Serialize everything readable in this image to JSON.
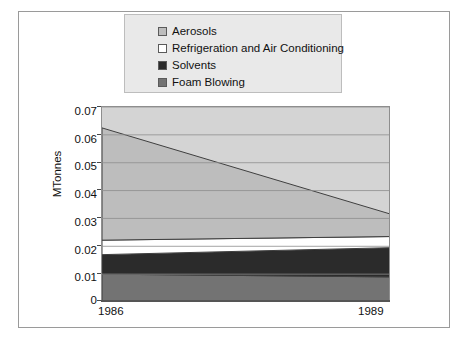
{
  "figure": {
    "background_color": "#ffffff",
    "frame_color": "#9a9a9a"
  },
  "legend": {
    "position": "top-center",
    "background_color": "#e9e9e9",
    "border_color": "#bdbdbd",
    "items": [
      {
        "label": "Aerosols",
        "color": "#bdbdbd",
        "icon": "legend-swatch-icon"
      },
      {
        "label": "Refrigeration and Air Conditioning",
        "color": "#ffffff",
        "icon": "legend-swatch-icon"
      },
      {
        "label": "Solvents",
        "color": "#2b2b2b",
        "icon": "legend-swatch-icon"
      },
      {
        "label": "Foam Blowing",
        "color": "#737373",
        "icon": "legend-swatch-icon"
      }
    ]
  },
  "axes": {
    "y_title": "MTonnes",
    "y_ticks": [
      "0.07",
      "0.06",
      "0.05",
      "0.04",
      "0.03",
      "0.02",
      "0.01",
      "0"
    ],
    "x_ticks": [
      "1986",
      "1989"
    ],
    "plot_background": "#d4d4d4",
    "gridline_color": "#8e8e8e"
  },
  "chart_data": {
    "type": "area",
    "title": "",
    "subtitle": "",
    "xlabel": "",
    "ylabel": "MTonnes",
    "x": [
      1986,
      1989
    ],
    "xlim": [
      1986,
      1989
    ],
    "ylim": [
      0,
      0.07
    ],
    "ytick_values": [
      0,
      0.01,
      0.02,
      0.03,
      0.04,
      0.05,
      0.06,
      0.07
    ],
    "grid": true,
    "stacked": true,
    "legend_position": "top-center",
    "series": [
      {
        "name": "Foam Blowing",
        "values": [
          0.01,
          0.009
        ],
        "color": "#737373"
      },
      {
        "name": "Solvents",
        "values": [
          0.007,
          0.0105
        ],
        "color": "#2b2b2b"
      },
      {
        "name": "Refrigeration and Air Conditioning",
        "values": [
          0.0052,
          0.004
        ],
        "color": "#ffffff"
      },
      {
        "name": "Aerosols",
        "values": [
          0.0403,
          0.008
        ],
        "color": "#bdbdbd"
      }
    ],
    "cumulative_tops": {
      "Foam Blowing": [
        0.01,
        0.009
      ],
      "Solvents": [
        0.017,
        0.0195
      ],
      "Refrigeration and Air Conditioning": [
        0.0222,
        0.0235
      ],
      "Aerosols": [
        0.0625,
        0.0315
      ]
    }
  }
}
